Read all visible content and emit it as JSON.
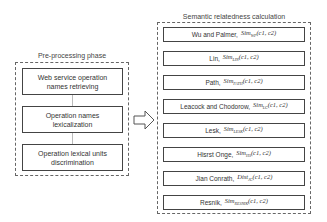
{
  "left_panel": {
    "title": "Pre-processing phase",
    "steps": [
      {
        "line1": "Web service operation",
        "line2": "names retrieving"
      },
      {
        "line1": "Operation names",
        "line2": "lexicalization"
      },
      {
        "line1": "Operation lexical units",
        "line2": "discrimination"
      }
    ]
  },
  "arrow": {
    "icon": "hollow-right-arrow-icon"
  },
  "right_panel": {
    "title": "Semantic relatedness calculation",
    "measures": [
      {
        "name": "Wu and Palmer,",
        "fn": "Sim",
        "sub": "WP",
        "args": "(c1, c2)"
      },
      {
        "name": "Lin,",
        "fn": "Sim",
        "sub": "LIN",
        "args": "(c1, c2)"
      },
      {
        "name": "Path,",
        "fn": "Sim",
        "sub": "PATH",
        "args": "(c1, c2)"
      },
      {
        "name": "Leacock and Chodorow,",
        "fn": "Sim",
        "sub": "LC",
        "args": "(c1, c2)"
      },
      {
        "name": "Lesk,",
        "fn": "Sim",
        "sub": "LESK",
        "args": "(c1, c2)"
      },
      {
        "name": "Hisrst Onge,",
        "fn": "Sim",
        "sub": "HS",
        "args": "(c1, c2)"
      },
      {
        "name": "Jian Conrath,",
        "fn": "Dist",
        "sub": "JC",
        "args": "(c1, c2)"
      },
      {
        "name": "Resnik,",
        "fn": "Sim",
        "sub": "RESNIK",
        "args": "(c1, c2)"
      }
    ]
  }
}
